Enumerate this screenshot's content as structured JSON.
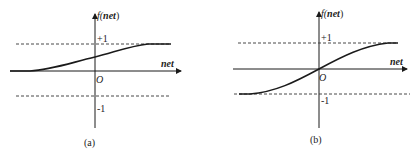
{
  "panels": [
    {
      "id": "a",
      "caption": "(a)",
      "y_axis_label": "f(net)",
      "y_axis_label_func": "f(",
      "y_axis_label_var": "net",
      "y_axis_label_close": ")",
      "x_axis_label": "net",
      "origin_label": "O",
      "upper_asymptote_label": "+1",
      "lower_asymptote_label": "-1",
      "curve": "unipolar sigmoid (range 0 to +1)"
    },
    {
      "id": "b",
      "caption": "(b)",
      "y_axis_label": "f(net)",
      "y_axis_label_func": "f(",
      "y_axis_label_var": "net",
      "y_axis_label_close": ")",
      "x_axis_label": "net",
      "origin_label": "O",
      "upper_asymptote_label": "+1",
      "lower_asymptote_label": "-1",
      "curve": "bipolar sigmoid (range -1 to +1)"
    }
  ],
  "colors": {
    "line": "#1a1a1a",
    "dashed": "#333333",
    "text": "#222222"
  }
}
